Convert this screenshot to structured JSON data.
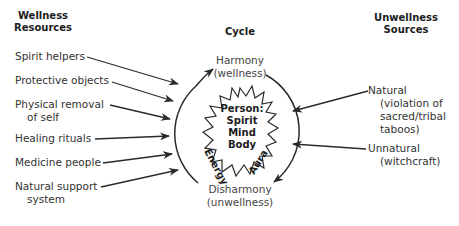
{
  "headers": {
    "left": [
      "Wellness",
      "Resources"
    ],
    "center": "Cycle",
    "right": [
      "Unwellness",
      "Sources"
    ]
  },
  "wellness_resources": [
    {
      "lines": [
        "Spirit helpers"
      ]
    },
    {
      "lines": [
        "Protective objects"
      ]
    },
    {
      "lines": [
        "Physical removal",
        "of self"
      ]
    },
    {
      "lines": [
        "Healing rituals"
      ]
    },
    {
      "lines": [
        "Medicine people"
      ]
    },
    {
      "lines": [
        "Natural support",
        "system"
      ]
    }
  ],
  "unwellness_sources": [
    {
      "lines": [
        "Natural",
        "(violation of",
        "sacred/tribal",
        "taboos)"
      ]
    },
    {
      "lines": [
        "Unnatural",
        "(witchcraft)"
      ]
    }
  ],
  "cycle": {
    "top_state": [
      "Harmony",
      "(wellness)"
    ],
    "bottom_state": [
      "Disharmony",
      "(unwellness)"
    ],
    "left_arc_label": "Energy",
    "right_arc_label": "Aura",
    "person": [
      "Person:",
      "Spirit",
      "Mind",
      "Body"
    ]
  },
  "colors": {
    "line": "#2a2a2a",
    "text": "#333333"
  }
}
